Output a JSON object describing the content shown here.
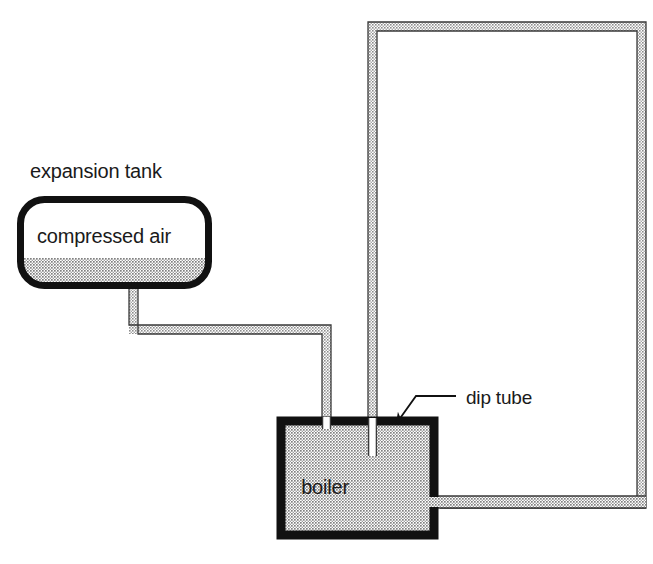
{
  "diagram": {
    "background_color": "#ffffff",
    "width": 653,
    "height": 564,
    "colors": {
      "outline": "#111111",
      "pipe_fill": "#b9b9b9",
      "pipe_outline": "#2b2b2b",
      "vessel_fill": "#b9b9b9",
      "vessel_outline": "#111111",
      "air_fill": "#ffffff",
      "water_fill": "#b9b9b9",
      "text": "#1a1a1a",
      "leader_line": "#111111"
    },
    "labels": {
      "expansion_tank": "expansion tank",
      "compressed_air": "compressed air",
      "boiler": "boiler",
      "dip_tube": "dip tube"
    },
    "components": {
      "expansion_tank": {
        "name": "expansion tank",
        "shape": "rounded-capsule",
        "x": 17,
        "y": 196,
        "width": 195,
        "height": 93,
        "corner_radius": 26,
        "border_width": 7,
        "contents_upper": "compressed air",
        "water_level_y": 258
      },
      "boiler": {
        "name": "boiler",
        "shape": "rectangle",
        "x": 281,
        "y": 421,
        "width": 153,
        "height": 114,
        "border_width": 9,
        "fill": "hatched-gray"
      },
      "dip_tube": {
        "name": "dip tube",
        "shape": "vertical-tube",
        "x": 368,
        "top_y": 421,
        "bottom_y": 456,
        "width": 9
      },
      "circulation_loop": {
        "name": "circulation loop pipe",
        "shape": "open-rectangle-path",
        "left_x": 368,
        "right_x": 646,
        "top_y": 22,
        "bottom_y": 508,
        "wall_thickness": 9
      },
      "tank_connection_pipe": {
        "name": "expansion tank connection pipe",
        "drop_x": 129,
        "drop_from_y": 286,
        "horizontal_y": 325,
        "run_to_x": 331,
        "enters_boiler_at_y": 421,
        "wall_thickness": 9
      },
      "boiler_outlet_pipe": {
        "name": "boiler outlet pipe",
        "from_x": 434,
        "to_x": 646,
        "y": 496,
        "wall_thickness": 12
      }
    },
    "annotation": {
      "name": "dip tube callout",
      "arrow_tip_x": 392,
      "arrow_tip_y": 428,
      "elbow_x": 416,
      "elbow_y": 396,
      "line_end_x": 456,
      "line_end_y": 396,
      "text_x": 466,
      "text_y": 403
    }
  }
}
